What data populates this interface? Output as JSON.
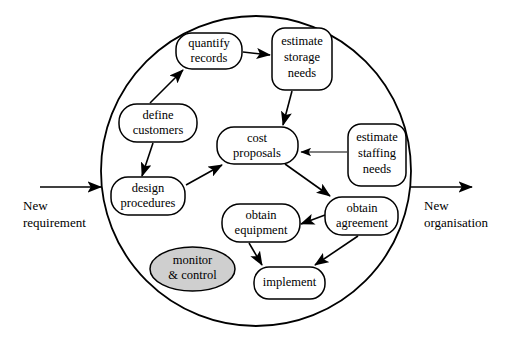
{
  "diagram": {
    "boundary": {
      "name": "organisation-boundary",
      "shape": "circle",
      "cx": 256,
      "cy": 171,
      "r": 155
    },
    "io": {
      "input": {
        "label_line1": "New",
        "label_line2": "requirement",
        "arrow_from_x": 40,
        "arrow_to_x": 103,
        "arrow_y": 187
      },
      "output": {
        "label_line1": "New",
        "label_line2": "organisation",
        "arrow_from_x": 410,
        "arrow_to_x": 472,
        "arrow_y": 187
      }
    },
    "nodes": [
      {
        "id": "quantify-records",
        "line1": "quantify",
        "line2": "records",
        "shape": "rounded-rect",
        "x": 176,
        "y": 33,
        "w": 66,
        "h": 36,
        "rx": 16,
        "shaded": false
      },
      {
        "id": "estimate-storage-needs",
        "line1": "estimate",
        "line2": "storage",
        "line3": "needs",
        "shape": "rounded-rect",
        "x": 272,
        "y": 28,
        "w": 60,
        "h": 62,
        "rx": 13,
        "shaded": false
      },
      {
        "id": "define-customers",
        "line1": "define",
        "line2": "customers",
        "shape": "rounded-rect",
        "x": 119,
        "y": 104,
        "w": 78,
        "h": 38,
        "rx": 18,
        "shaded": false
      },
      {
        "id": "cost-proposals",
        "line1": "cost",
        "line2": "proposals",
        "shape": "rounded-rect",
        "x": 217,
        "y": 127,
        "w": 81,
        "h": 37,
        "rx": 17,
        "shaded": false
      },
      {
        "id": "estimate-staffing-needs",
        "line1": "estimate",
        "line2": "staffing",
        "line3": "needs",
        "shape": "rounded-rect",
        "x": 348,
        "y": 124,
        "w": 58,
        "h": 62,
        "rx": 13,
        "shaded": false
      },
      {
        "id": "design-procedures",
        "line1": "design",
        "line2": "procedures",
        "shape": "rounded-rect",
        "x": 111,
        "y": 177,
        "w": 74,
        "h": 38,
        "rx": 17,
        "shaded": false
      },
      {
        "id": "obtain-equipment",
        "line1": "obtain",
        "line2": "equipment",
        "shape": "rounded-rect",
        "x": 222,
        "y": 204,
        "w": 78,
        "h": 38,
        "rx": 18,
        "shaded": false
      },
      {
        "id": "obtain-agreement",
        "line1": "obtain",
        "line2": "agreement",
        "shape": "rounded-rect",
        "x": 325,
        "y": 197,
        "w": 73,
        "h": 38,
        "rx": 17,
        "shaded": false
      },
      {
        "id": "monitor-control",
        "line1": "monitor",
        "line2": "& control",
        "shape": "ellipse",
        "x": 150,
        "y": 247,
        "w": 85,
        "h": 44,
        "rx": 0,
        "shaded": true
      },
      {
        "id": "implement",
        "line1": "implement",
        "shape": "rounded-rect",
        "x": 254,
        "y": 267,
        "w": 71,
        "h": 32,
        "rx": 15,
        "shaded": false
      }
    ],
    "edges": [
      {
        "id": "define-to-quantify",
        "from": "define-customers",
        "to": "quantify-records"
      },
      {
        "id": "quantify-to-estimate-storage",
        "from": "quantify-records",
        "to": "estimate-storage-needs"
      },
      {
        "id": "estimate-storage-to-cost",
        "from": "estimate-storage-needs",
        "to": "cost-proposals"
      },
      {
        "id": "define-to-design",
        "from": "define-customers",
        "to": "design-procedures"
      },
      {
        "id": "design-to-cost",
        "from": "design-procedures",
        "to": "cost-proposals"
      },
      {
        "id": "staffing-to-cost",
        "from": "estimate-staffing-needs",
        "to": "cost-proposals"
      },
      {
        "id": "cost-to-agreement",
        "from": "cost-proposals",
        "to": "obtain-agreement"
      },
      {
        "id": "agreement-to-equipment",
        "from": "obtain-agreement",
        "to": "obtain-equipment"
      },
      {
        "id": "equipment-to-implement",
        "from": "obtain-equipment",
        "to": "implement"
      },
      {
        "id": "agreement-to-implement",
        "from": "obtain-agreement",
        "to": "implement"
      }
    ],
    "colors": {
      "stroke": "#000000",
      "fill": "#ffffff",
      "shaded_fill": "#cfcfcf",
      "background": "#ffffff"
    }
  }
}
